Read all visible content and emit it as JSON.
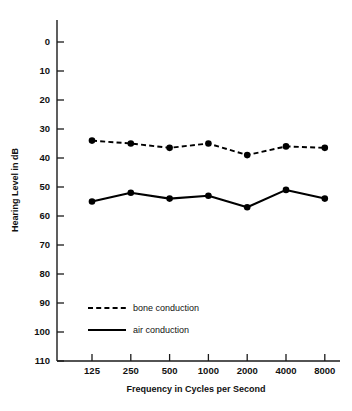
{
  "chart_data": {
    "type": "line",
    "title": "",
    "subtitle": "",
    "xlabel": "Frequency in Cycles per Second",
    "ylabel": "Hearing Level in dB",
    "categories": [
      "125",
      "250",
      "500",
      "1000",
      "2000",
      "4000",
      "8000"
    ],
    "x_tick_labels": [
      "125",
      "250",
      "500",
      "1000",
      "2000",
      "4000",
      "8000"
    ],
    "y_tick_labels": [
      "0",
      "10",
      "20",
      "30",
      "40",
      "50",
      "60",
      "70",
      "80",
      "90",
      "100",
      "110"
    ],
    "y_tick_values": [
      0,
      10,
      20,
      30,
      40,
      50,
      60,
      70,
      80,
      90,
      100,
      110
    ],
    "ylim": [
      0,
      110
    ],
    "y_axis_inverted": true,
    "grid": false,
    "legend_position": "inside-lower-left",
    "series": [
      {
        "name": "bone conduction",
        "style": "dashed",
        "marker": "filled-circle",
        "color": "#000000",
        "values": [
          34,
          35,
          36.5,
          35,
          39,
          36,
          36.5
        ]
      },
      {
        "name": "air conduction",
        "style": "solid",
        "marker": "filled-circle",
        "color": "#000000",
        "values": [
          55,
          52,
          54,
          53,
          57,
          51,
          54
        ]
      }
    ]
  },
  "legend": {
    "items": [
      {
        "label": "bone conduction",
        "style": "dashed"
      },
      {
        "label": "air conduction",
        "style": "solid"
      }
    ]
  },
  "colors": {
    "ink": "#000000",
    "axis": "#1a1a1a",
    "background": "#ffffff"
  }
}
